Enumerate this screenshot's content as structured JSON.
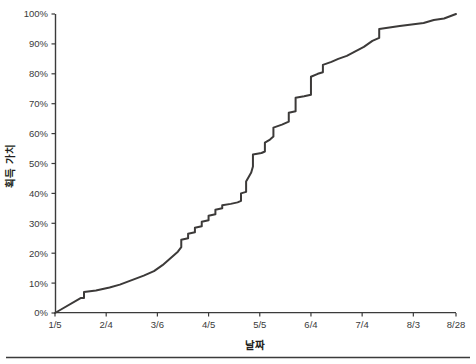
{
  "chart_data": {
    "type": "line",
    "title": "",
    "subtitle": "",
    "xlabel": "날짜",
    "ylabel": "획득 가치",
    "grid": false,
    "legend": false,
    "line_color": "#3c3a39",
    "axis_color": "#3b3b3b",
    "xlim": [
      0,
      235
    ],
    "ylim": [
      0,
      100
    ],
    "x_tick_labels": [
      "1/5",
      "2/4",
      "3/6",
      "4/5",
      "5/5",
      "6/4",
      "7/4",
      "8/3",
      "8/28"
    ],
    "x_tick_values": [
      0,
      30,
      60,
      90,
      120,
      150,
      180,
      210,
      235
    ],
    "y_tick_labels": [
      "0%",
      "10%",
      "20%",
      "30%",
      "40%",
      "50%",
      "60%",
      "70%",
      "80%",
      "90%",
      "100%"
    ],
    "y_tick_values": [
      0,
      10,
      20,
      30,
      40,
      50,
      60,
      70,
      80,
      90,
      100
    ],
    "series": [
      {
        "name": "획득 가치 (누적)",
        "x": [
          0,
          3,
          15,
          17,
          17,
          24,
          32,
          38,
          45,
          52,
          58,
          63,
          67,
          72,
          74,
          74,
          78,
          78,
          82,
          82,
          86,
          86,
          90,
          90,
          94,
          94,
          98,
          98,
          103,
          107,
          109,
          109,
          112,
          112,
          115,
          116,
          116,
          121,
          123,
          123,
          126,
          128,
          128,
          133,
          137,
          137,
          141,
          141,
          146,
          150,
          150,
          154,
          157,
          157,
          162,
          166,
          171,
          176,
          181,
          186,
          190,
          190,
          196,
          202,
          209,
          216,
          222,
          228,
          235
        ],
        "y": [
          0,
          1,
          5,
          5,
          7,
          7.5,
          8.5,
          9.5,
          11,
          12.5,
          14,
          16,
          18,
          20.5,
          22,
          24.5,
          25,
          26.5,
          27,
          28.5,
          29,
          30.5,
          31,
          32.5,
          33,
          34.5,
          35,
          36,
          36.5,
          37,
          37.5,
          40,
          40.5,
          44,
          47,
          49,
          53,
          53.5,
          54,
          57,
          58,
          59,
          62,
          63,
          64,
          67,
          67.5,
          72,
          72.5,
          73,
          79,
          80,
          80.5,
          83,
          84,
          85,
          86,
          87.5,
          89,
          91,
          92,
          95,
          95.5,
          96,
          96.5,
          97,
          98,
          98.5,
          100
        ]
      }
    ],
    "annotations": []
  },
  "figure": {
    "plot_left_px": 55,
    "plot_right_px": 456,
    "plot_top_px": 14,
    "plot_bottom_px": 313,
    "footer_rule": true
  }
}
